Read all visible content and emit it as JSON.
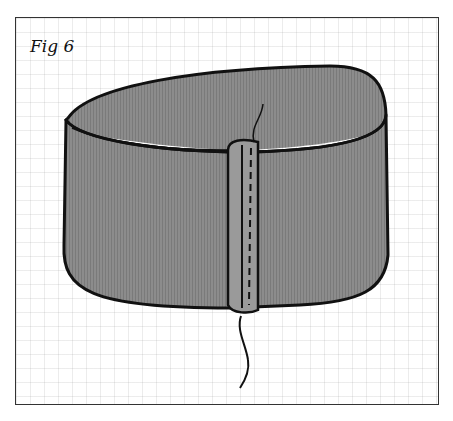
{
  "figure": {
    "label": "Fig 6",
    "colors": {
      "fabric": "#8a8a8a",
      "outline": "#111111",
      "grid": "#d0d0d0",
      "background": "#ffffff"
    }
  }
}
